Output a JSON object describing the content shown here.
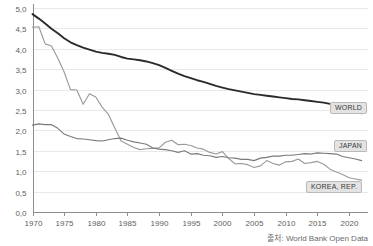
{
  "chart_data": {
    "type": "line",
    "title": "",
    "subtitle": "",
    "xlabel": "",
    "ylabel": "",
    "xlim": [
      1970,
      2023
    ],
    "ylim": [
      0.0,
      5.0
    ],
    "grid": true,
    "legend_position": "inline-right-end-labels",
    "source_note": "출처: World Bank Open Data",
    "ytick_labels": [
      "0,0",
      "0,5",
      "1,0",
      "1,5",
      "2,0",
      "2,5",
      "3,0",
      "3,5",
      "4,0",
      "4,5",
      "5,0"
    ],
    "ytick_values": [
      0.0,
      0.5,
      1.0,
      1.5,
      2.0,
      2.5,
      3.0,
      3.5,
      4.0,
      4.5,
      5.0
    ],
    "xtick_labels": [
      "1970",
      "1975",
      "1980",
      "1985",
      "1990",
      "1995",
      "2000",
      "2005",
      "2010",
      "2015",
      "2020"
    ],
    "xtick_values": [
      1970,
      1975,
      1980,
      1985,
      1990,
      1995,
      2000,
      2005,
      2010,
      2015,
      2020
    ],
    "x": [
      1970,
      1971,
      1972,
      1973,
      1974,
      1975,
      1976,
      1977,
      1978,
      1979,
      1980,
      1981,
      1982,
      1983,
      1984,
      1985,
      1986,
      1987,
      1988,
      1989,
      1990,
      1991,
      1992,
      1993,
      1994,
      1995,
      1996,
      1997,
      1998,
      1999,
      2000,
      2001,
      2002,
      2003,
      2004,
      2005,
      2006,
      2007,
      2008,
      2009,
      2010,
      2011,
      2012,
      2013,
      2014,
      2015,
      2016,
      2017,
      2018,
      2019,
      2020,
      2021,
      2022
    ],
    "series": [
      {
        "name": "WORLD",
        "label": "WORLD",
        "color": "#2b2b2b",
        "values": [
          4.85,
          4.74,
          4.62,
          4.49,
          4.38,
          4.26,
          4.16,
          4.09,
          4.03,
          3.98,
          3.93,
          3.9,
          3.88,
          3.85,
          3.8,
          3.76,
          3.74,
          3.72,
          3.69,
          3.65,
          3.6,
          3.53,
          3.46,
          3.39,
          3.33,
          3.28,
          3.23,
          3.19,
          3.14,
          3.09,
          3.05,
          3.01,
          2.98,
          2.95,
          2.92,
          2.89,
          2.87,
          2.85,
          2.83,
          2.81,
          2.79,
          2.77,
          2.76,
          2.74,
          2.72,
          2.7,
          2.68,
          2.65,
          2.62,
          2.58,
          2.5,
          2.46,
          2.42
        ]
      },
      {
        "name": "JAPAN",
        "label": "JAPAN",
        "color": "#7a7a7a",
        "values": [
          2.13,
          2.16,
          2.14,
          2.14,
          2.05,
          1.91,
          1.85,
          1.8,
          1.79,
          1.77,
          1.75,
          1.74,
          1.77,
          1.8,
          1.81,
          1.76,
          1.72,
          1.69,
          1.66,
          1.57,
          1.54,
          1.53,
          1.5,
          1.46,
          1.5,
          1.42,
          1.43,
          1.39,
          1.38,
          1.34,
          1.36,
          1.33,
          1.32,
          1.29,
          1.29,
          1.26,
          1.32,
          1.34,
          1.37,
          1.37,
          1.39,
          1.39,
          1.41,
          1.43,
          1.42,
          1.45,
          1.44,
          1.43,
          1.42,
          1.36,
          1.33,
          1.3,
          1.26
        ]
      },
      {
        "name": "KOREA, REP.",
        "label": "KOREA, REP.",
        "color": "#9a9a9a",
        "values": [
          4.53,
          4.54,
          4.12,
          4.07,
          3.77,
          3.43,
          3.0,
          2.99,
          2.64,
          2.9,
          2.82,
          2.57,
          2.39,
          2.06,
          1.74,
          1.66,
          1.58,
          1.53,
          1.55,
          1.56,
          1.57,
          1.71,
          1.76,
          1.65,
          1.66,
          1.63,
          1.57,
          1.54,
          1.46,
          1.42,
          1.48,
          1.31,
          1.18,
          1.19,
          1.16,
          1.09,
          1.13,
          1.26,
          1.19,
          1.15,
          1.23,
          1.24,
          1.3,
          1.19,
          1.21,
          1.24,
          1.17,
          1.05,
          0.98,
          0.92,
          0.84,
          0.81,
          0.78
        ]
      }
    ]
  },
  "labels": {
    "world": "WORLD",
    "japan": "JAPAN",
    "korea": "KOREA, REP."
  },
  "source": {
    "text": "출처: World Bank Open Data"
  }
}
